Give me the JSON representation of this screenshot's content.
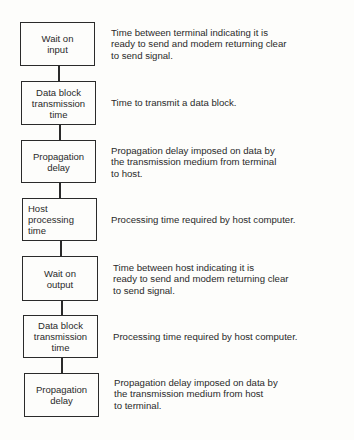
{
  "diagram": {
    "steps": [
      {
        "label": "Wait on\ninput",
        "description": "Time between terminal indicating it is\nready to send and modem returning clear\nto send signal."
      },
      {
        "label": "Data block\ntransmission\ntime",
        "description": "Time to transmit a data block."
      },
      {
        "label": "Propagation\ndelay",
        "description": "Propagation delay imposed on data by\nthe transmission medium from terminal\nto host."
      },
      {
        "label": "Host\nprocessing\ntime",
        "description": "Processing time required by host computer."
      },
      {
        "label": "Wait on\noutput",
        "description": "Time between host indicating it is\nready to send and modem returning clear\nto send signal."
      },
      {
        "label": "Data block\ntransmission\ntime",
        "description": "Processing time required by host computer."
      },
      {
        "label": "Propagation\ndelay",
        "description": "Propagation delay imposed on data by\nthe transmission medium from host\nto terminal."
      }
    ],
    "colors": {
      "ink": "#2a2a2a",
      "paper": "#fdfdfb"
    }
  }
}
